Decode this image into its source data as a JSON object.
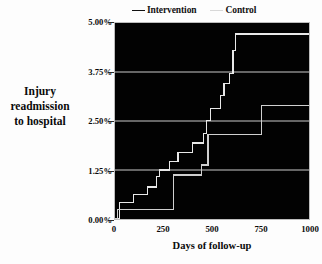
{
  "chart_data": {
    "type": "line",
    "title": "",
    "subtitle": "",
    "xlabel": "Days of follow-up",
    "ylabel": "Injury readmission to hospital",
    "ylabel_lines": [
      "Injury",
      "readmission",
      "to hospital"
    ],
    "xlim": [
      0,
      1000
    ],
    "ylim": [
      0,
      5.0
    ],
    "xticks": [
      0,
      250,
      500,
      750,
      1000
    ],
    "xtick_labels": [
      "0",
      "250",
      "500",
      "750",
      "1000"
    ],
    "yticks": [
      0.0,
      1.25,
      2.5,
      3.75,
      5.0
    ],
    "ytick_labels": [
      "0.00%",
      "1.25%",
      "2.50%",
      "3.75%",
      "5.00%"
    ],
    "grid": true,
    "grid_axis": "y",
    "legend_position": "top",
    "plot_background": "#020202",
    "line_color": "#e8e8e8",
    "grid_color": "#c9c9c9",
    "step_type": "post",
    "series": [
      {
        "name": "Intervention",
        "color": "#e8e8e8",
        "x": [
          0,
          18,
          22,
          55,
          95,
          130,
          168,
          205,
          215,
          228,
          255,
          282,
          300,
          325,
          352,
          398,
          432,
          455,
          470,
          492,
          518,
          545,
          562,
          590,
          608,
          620,
          1000
        ],
        "y": [
          0.0,
          0.0,
          0.42,
          0.42,
          0.63,
          0.63,
          0.82,
          0.82,
          1.08,
          1.25,
          1.25,
          1.46,
          1.46,
          1.7,
          1.7,
          1.94,
          1.94,
          2.18,
          2.52,
          2.82,
          2.82,
          3.15,
          3.45,
          3.72,
          4.3,
          4.72,
          4.72
        ]
      },
      {
        "name": "Control",
        "color": "#cfcfcf",
        "x": [
          0,
          10,
          12,
          290,
          300,
          430,
          445,
          470,
          480,
          745,
          755,
          1000
        ],
        "y": [
          0.0,
          0.0,
          0.25,
          0.25,
          1.12,
          1.12,
          1.38,
          1.38,
          2.15,
          2.15,
          2.9,
          2.9
        ]
      }
    ]
  },
  "legend": {
    "items": [
      {
        "label": "Intervention",
        "marker": "line",
        "color": "#111111"
      },
      {
        "label": "Control",
        "marker": "line",
        "color": "#d8d8d8"
      }
    ]
  }
}
